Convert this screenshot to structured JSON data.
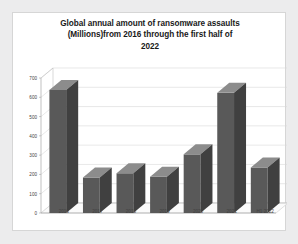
{
  "chart_data": {
    "type": "bar",
    "title": "Global annual amount of ransomware assaults (Millions)from 2016 through the first half of 2022",
    "title_lines": [
      "Global annual amount of ransomware assaults",
      "(Millions)from 2016 through the first half of",
      "2022"
    ],
    "categories": [
      "2016",
      "2017",
      "2018",
      "2019",
      "2020",
      "2021",
      "H1 2022"
    ],
    "values": [
      638,
      184,
      206,
      188,
      304,
      623,
      236
    ],
    "xlabel": "",
    "ylabel": "",
    "ylim": [
      0,
      700
    ],
    "yticks": [
      0,
      100,
      200,
      300,
      400,
      500,
      600,
      700
    ],
    "ytick_labels": [
      "0",
      "100",
      "200",
      "300",
      "400",
      "500",
      "600",
      "700"
    ],
    "grid": true,
    "legend": false,
    "series_color": "#595959",
    "style": "3d-column"
  }
}
